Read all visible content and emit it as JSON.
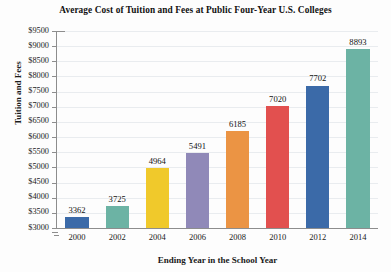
{
  "chart_data": {
    "type": "bar",
    "title": "Average Cost of Tuition and Fees at Public Four-Year U.S. Colleges",
    "xlabel": "Ending Year in the School Year",
    "ylabel": "Tuition and Fees",
    "categories": [
      "2000",
      "2002",
      "2004",
      "2006",
      "2008",
      "2010",
      "2012",
      "2014"
    ],
    "values": [
      3362,
      3725,
      4964,
      5491,
      6185,
      7020,
      7702,
      8893
    ],
    "value_labels": [
      "3362",
      "3725",
      "4964",
      "5491",
      "6185",
      "7020",
      "7702",
      "8893"
    ],
    "bar_colors": [
      "#3b6aa8",
      "#6cb3a4",
      "#f0c92b",
      "#9089b8",
      "#eb9444",
      "#e2504f",
      "#3b6aa8",
      "#6cb3a4"
    ],
    "ylim": [
      3000,
      9500
    ],
    "ytick_labels": [
      "$9500",
      "$9000",
      "$8500",
      "$8000",
      "$7500",
      "$7000",
      "$6500",
      "$6000",
      "$5500",
      "$5000",
      "$4500",
      "$4000",
      "$3500",
      "$3000"
    ],
    "ytick_values": [
      9500,
      9000,
      8500,
      8000,
      7500,
      7000,
      6500,
      6000,
      5500,
      5000,
      4500,
      4000,
      3500,
      3000
    ],
    "grid": true,
    "legend": false,
    "grid_color": "#e9ecef",
    "axis_color": "#8d8d8d",
    "background": "#fdfdfd"
  }
}
